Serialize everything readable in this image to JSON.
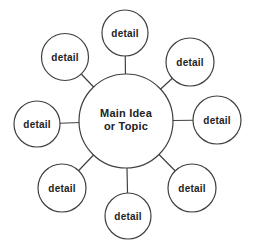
{
  "diagram": {
    "type": "cluster-web-graphic-organizer",
    "background_color": "#ffffff",
    "stroke_color": "#404040",
    "text_color": "#222222",
    "node_fill_color": "#ffffff",
    "stroke_width": 1.2,
    "center_node": {
      "label": "Main Idea or Topic",
      "label_lines": [
        "Main Idea",
        "or Topic"
      ],
      "x": 126,
      "y": 121,
      "r": 47,
      "font_size": 11,
      "line_baselines": [
        117,
        130
      ]
    },
    "detail_nodes": [
      {
        "label": "detail",
        "position": "top",
        "x": 125,
        "y": 33,
        "r": 23
      },
      {
        "label": "detail",
        "position": "top-right",
        "x": 190,
        "y": 62,
        "r": 24
      },
      {
        "label": "detail",
        "position": "right",
        "x": 217,
        "y": 120,
        "r": 24
      },
      {
        "label": "detail",
        "position": "bottom-right",
        "x": 192,
        "y": 188,
        "r": 24
      },
      {
        "label": "detail",
        "position": "bottom",
        "x": 128,
        "y": 216,
        "r": 23
      },
      {
        "label": "detail",
        "position": "bottom-left",
        "x": 62,
        "y": 188,
        "r": 24
      },
      {
        "label": "detail",
        "position": "left",
        "x": 37,
        "y": 124,
        "r": 23
      },
      {
        "label": "detail",
        "position": "top-left",
        "x": 65,
        "y": 57,
        "r": 23.5
      }
    ],
    "detail_font_size": 10
  }
}
